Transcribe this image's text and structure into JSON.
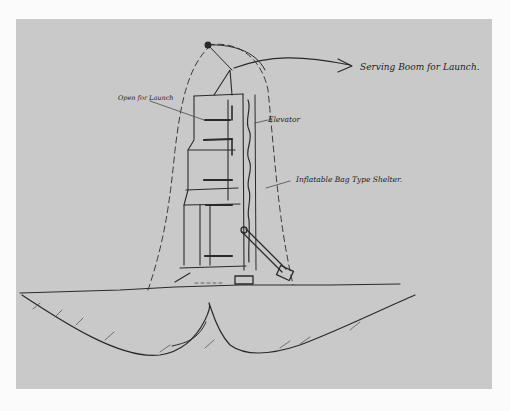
{
  "document": {
    "type": "hand-drawn sketch",
    "subject": "Launch tower with inflatable shelter"
  },
  "annotations": {
    "servicing_boom": "Serving Boom for Launch.",
    "open_for_launch": "Open for Launch",
    "elevator": "Elevator",
    "shelter": "Inflatable Bag Type Shelter."
  },
  "colors": {
    "paper": "#c9c9c9",
    "ink": "#2a2a2a",
    "background": "#fbfbfb"
  }
}
